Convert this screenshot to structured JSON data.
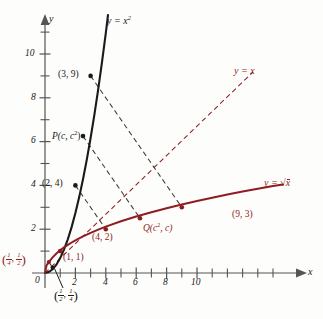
{
  "figure": {
    "colors": {
      "curve_parabola": "#1a1a1a",
      "curve_sqrt": "#8e1d23",
      "line_y_equals_x": "#8e1d23",
      "dashed_black": "#3a3a3a",
      "axis": "#555555",
      "background": "#fdfdfb"
    }
  },
  "axes": {
    "x_label": "x",
    "y_label": "y",
    "origin_label": "0",
    "x_ticks": [
      "2",
      "4",
      "6",
      "8",
      "10"
    ],
    "x_tick_values": [
      2,
      4,
      6,
      8,
      10
    ],
    "x_minor_ticks": [
      1,
      3,
      5,
      7,
      9,
      11
    ],
    "y_ticks": [
      "2",
      "4",
      "6",
      "8",
      "10"
    ],
    "y_tick_values": [
      2,
      4,
      6,
      8,
      10
    ],
    "y_minor_ticks": [
      1,
      3,
      5,
      7,
      9,
      11
    ],
    "xlim": [
      -0.9,
      11.6
    ],
    "ylim": [
      -1.0,
      11.4
    ]
  },
  "curves": [
    {
      "name": "parabola",
      "label": "y = x",
      "label_exponent": "2",
      "equation": "y = x^2",
      "color": "#1a1a1a",
      "style": "solid"
    },
    {
      "name": "square-root",
      "label": "y = ",
      "label_radicand": "x",
      "equation": "y = sqrt(x)",
      "color": "#8e1d23",
      "style": "solid"
    },
    {
      "name": "identity-line",
      "label": "y = x",
      "equation": "y = x",
      "color": "#8e1d23",
      "style": "dashed"
    }
  ],
  "points": [
    {
      "name": "point-3-9",
      "label": "(3, 9)",
      "x": 3,
      "y": 9,
      "color": "#1a1a1a",
      "on": "parabola"
    },
    {
      "name": "point-p",
      "label": "P(c, c",
      "sup": "2",
      "suffix": ")",
      "x": 2.5,
      "y": 6.25,
      "color": "#1a1a1a",
      "on": "parabola"
    },
    {
      "name": "point-2-4",
      "label": "(2, 4)",
      "x": 2,
      "y": 4,
      "color": "#1a1a1a",
      "on": "parabola"
    },
    {
      "name": "point-1-1",
      "label": "(1, 1)",
      "x": 1,
      "y": 1,
      "color": "#8e1d23",
      "on": "both"
    },
    {
      "name": "point-4-2",
      "label": "(4, 2)",
      "x": 4,
      "y": 2,
      "color": "#8e1d23",
      "on": "square-root"
    },
    {
      "name": "point-q",
      "label": "Q(c",
      "sup": "2",
      "suffix": ", c)",
      "x": 6.25,
      "y": 2.5,
      "color": "#8e1d23",
      "on": "square-root"
    },
    {
      "name": "point-9-3",
      "label": "(9, 3)",
      "x": 9,
      "y": 3,
      "color": "#8e1d23",
      "on": "square-root"
    },
    {
      "name": "point-quarter-half",
      "label": "(1/4, 1/2)",
      "num1": "1",
      "den1": "4",
      "num2": "1",
      "den2": "2",
      "x": 0.25,
      "y": 0.5,
      "color": "#8e1d23",
      "on": "square-root"
    },
    {
      "name": "point-half-quarter",
      "label": "(1/2, 1/4)",
      "num1": "1",
      "den1": "2",
      "num2": "1",
      "den2": "4",
      "x": 0.5,
      "y": 0.25,
      "color": "#1a1a1a",
      "on": "parabola"
    }
  ],
  "reflection_segments": [
    {
      "name": "segment-3-9-to-9-3",
      "from": [
        3,
        9
      ],
      "to": [
        9,
        3
      ],
      "color": "#3a3a3a"
    },
    {
      "name": "segment-p-to-q",
      "from": [
        2.5,
        6.25
      ],
      "to": [
        6.25,
        2.5
      ],
      "color": "#3a3a3a"
    },
    {
      "name": "segment-2-4-to-4-2",
      "from": [
        2,
        4
      ],
      "to": [
        4,
        2
      ],
      "color": "#3a3a3a"
    },
    {
      "name": "segment-half-quarter-pair",
      "from": [
        0.5,
        0.25
      ],
      "to": [
        0.25,
        0.5
      ],
      "color": "#3a3a3a"
    }
  ]
}
